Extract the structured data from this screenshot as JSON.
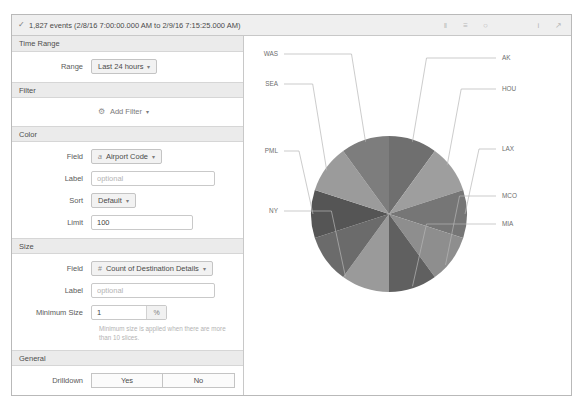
{
  "statusbar": {
    "check_icon": "check-icon",
    "events_text": "1,827 events (2/8/16 7:00:00.000 AM to 2/9/16 7:15:25.000 AM)",
    "icons": [
      {
        "name": "columns-icon",
        "glyph": "‖"
      },
      {
        "name": "list-icon",
        "glyph": "≡"
      },
      {
        "name": "clock-icon",
        "glyph": "○"
      },
      {
        "name": "info-icon",
        "glyph": "i"
      },
      {
        "name": "export-icon",
        "glyph": "↗"
      }
    ]
  },
  "sections": {
    "time_range": {
      "title": "Time Range",
      "range_label": "Range",
      "range_value": "Last 24 hours"
    },
    "filter": {
      "title": "Filter",
      "add_filter_label": "Add Filter"
    },
    "color": {
      "title": "Color",
      "field_label": "Field",
      "field_type_mark": "a",
      "field_value": "Airport Code",
      "label_label": "Label",
      "label_placeholder": "optional",
      "label_value": "",
      "sort_label": "Sort",
      "sort_value": "Default",
      "limit_label": "Limit",
      "limit_value": "100"
    },
    "size": {
      "title": "Size",
      "field_label": "Field",
      "field_type_mark": "#",
      "field_value": "Count of Destination Details",
      "label_label": "Label",
      "label_placeholder": "optional",
      "label_value": "",
      "minimum_size_label": "Minimum Size",
      "minimum_size_value": "1",
      "minimum_size_unit": "%",
      "hint": "Minimum size is applied when there are more than 10 slices."
    },
    "general": {
      "title": "General",
      "drilldown_label": "Drilldown",
      "yes_label": "Yes",
      "no_label": "No"
    }
  },
  "chart_data": {
    "type": "pie",
    "title": "",
    "categories": [
      "AK",
      "HOU",
      "LAX",
      "MCO",
      "MIA",
      "NY",
      "PML",
      "SEA",
      "WAS"
    ],
    "labels": [
      "AK",
      "HOU",
      "LAX",
      "MCO",
      "MIA",
      "NY",
      "PML",
      "SEA",
      "WAS"
    ],
    "values": [
      10,
      10,
      10,
      10,
      10,
      10,
      10,
      10,
      20
    ],
    "slice_count": 10,
    "colors": [
      "#6f6f6f",
      "#9e9e9e",
      "#767676",
      "#8e8e8e",
      "#606060",
      "#9a9a9a",
      "#6b6b6b",
      "#555555",
      "#9b9b9b",
      "#7d7d7d"
    ],
    "legend": "labels-outside",
    "grid": false
  }
}
